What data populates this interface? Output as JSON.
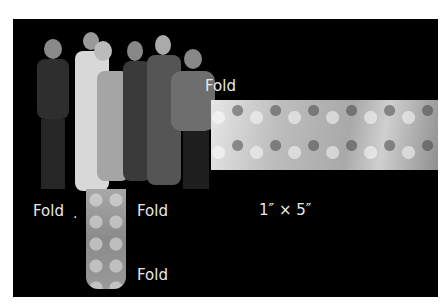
{
  "image": {
    "description": "Group photo of six people cut out on black background with a long patterned fabric strip to the right and a vertical patterned strip below",
    "labels": {
      "fold_top_right": "Fold",
      "fold_left": "Fold",
      "fold_left_dot": ".",
      "fold_middle": "Fold",
      "fold_bottom": "Fold",
      "dimensions": "1″ × 5″"
    }
  }
}
